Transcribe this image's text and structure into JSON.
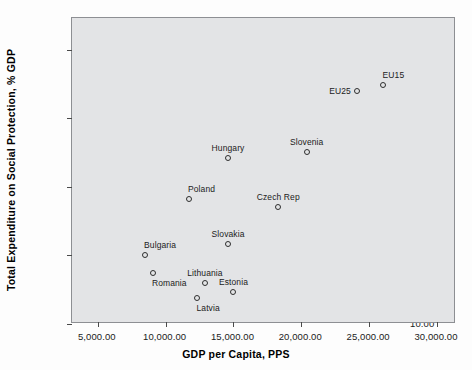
{
  "chart_data": {
    "type": "scatter",
    "title": "",
    "xlabel": "GDP per Capita, PPS",
    "ylabel": "Total Expenditure on Social Protection, % GDP",
    "xlim": [
      3100,
      31400
    ],
    "ylim": [
      10.0,
      32.3
    ],
    "xticks": [
      5000,
      10000,
      15000,
      20000,
      25000,
      30000
    ],
    "xticklabels": [
      "5,000.00",
      "10,000.00",
      "15,000.00",
      "20,000.00",
      "25,000.00",
      "30,000.00"
    ],
    "yticks": [
      10.0,
      15.0,
      20.0,
      25.0,
      30.0
    ],
    "yticklabels": [
      "10.00",
      "15.00",
      "20.00",
      "25.00",
      "30.00"
    ],
    "grid": false,
    "legend": "none",
    "marker_style": "open-circle",
    "points": [
      {
        "label": "EU15",
        "x": 26000,
        "y": 27.4,
        "label_pos": "above-right"
      },
      {
        "label": "EU25",
        "x": 24100,
        "y": 27.0,
        "label_pos": "left"
      },
      {
        "label": "Slovenia",
        "x": 20400,
        "y": 22.5,
        "label_pos": "above"
      },
      {
        "label": "Hungary",
        "x": 14600,
        "y": 22.1,
        "label_pos": "above"
      },
      {
        "label": "Poland",
        "x": 11700,
        "y": 19.1,
        "label_pos": "above-right"
      },
      {
        "label": "Czech Rep",
        "x": 18300,
        "y": 18.5,
        "label_pos": "above"
      },
      {
        "label": "Slovakia",
        "x": 14600,
        "y": 15.8,
        "label_pos": "above"
      },
      {
        "label": "Bulgaria",
        "x": 8500,
        "y": 15.0,
        "label_pos": "above-right"
      },
      {
        "label": "Romania",
        "x": 9100,
        "y": 13.7,
        "label_pos": "below-right"
      },
      {
        "label": "Lithuania",
        "x": 12900,
        "y": 13.0,
        "label_pos": "above"
      },
      {
        "label": "Estonia",
        "x": 15000,
        "y": 12.3,
        "label_pos": "above"
      },
      {
        "label": "Latvia",
        "x": 12300,
        "y": 11.9,
        "label_pos": "below-right"
      }
    ]
  }
}
